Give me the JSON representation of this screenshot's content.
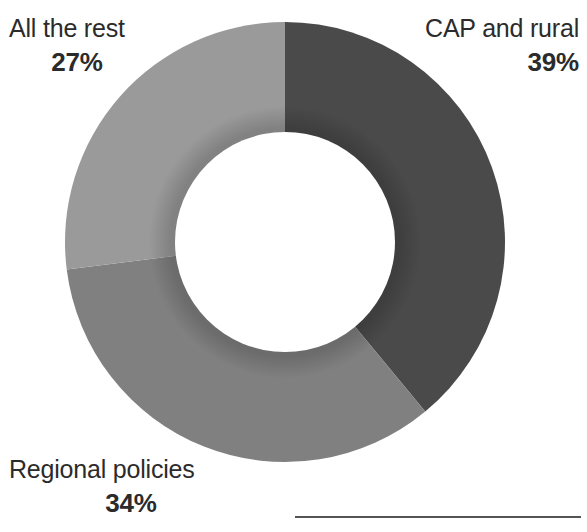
{
  "chart_data": {
    "type": "pie",
    "variant": "donut",
    "title": "",
    "subtitle": "",
    "xlabel": "",
    "ylabel": "",
    "legend_position": "callout-labels",
    "grid": false,
    "units": "percent",
    "total": 100,
    "center": {
      "x": 285,
      "y": 242
    },
    "outer_radius": 220,
    "inner_radius": 110,
    "start_angle_deg": 0,
    "direction": "clockwise",
    "categories": [
      "CAP and rural",
      "Regional policies",
      "All the rest"
    ],
    "values": [
      39,
      34,
      27
    ],
    "value_labels": [
      "39%",
      "34%",
      "27%"
    ],
    "colors": [
      "#4a4a4a",
      "#808080",
      "#9a9a9a"
    ],
    "slices": [
      {
        "label": "CAP and rural",
        "value": 39,
        "value_label": "39%",
        "color": "#4a4a4a",
        "start_deg": 0,
        "end_deg": 140.4
      },
      {
        "label": "Regional policies",
        "value": 34,
        "value_label": "34%",
        "color": "#808080",
        "start_deg": 140.4,
        "end_deg": 262.8
      },
      {
        "label": "All the rest",
        "value": 27,
        "value_label": "27%",
        "color": "#9a9a9a",
        "start_deg": 262.8,
        "end_deg": 360
      }
    ]
  },
  "labels": {
    "cap": {
      "category": "CAP and rural",
      "percent": "39%"
    },
    "regional": {
      "category": "Regional policies",
      "percent": "34%"
    },
    "rest": {
      "category": "All the rest",
      "percent": "27%"
    }
  },
  "colors": {
    "slice_cap": "#4a4a4a",
    "slice_regional": "#808080",
    "slice_rest": "#9a9a9a",
    "text": "#2b2b2b",
    "rule": "#545454",
    "background": "#ffffff"
  }
}
